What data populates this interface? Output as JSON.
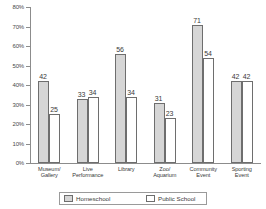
{
  "chart_data": {
    "type": "bar",
    "title": "",
    "subtitle": "",
    "xlabel": "",
    "ylabel": "",
    "ylim": [
      0,
      80
    ],
    "ytick_labels": [
      "80%",
      "70%",
      "60%",
      "50%",
      "40%",
      "30%",
      "20%",
      "10%",
      "0%"
    ],
    "ytick_values": [
      80,
      70,
      60,
      50,
      40,
      30,
      20,
      10,
      0
    ],
    "grid": false,
    "legend_position": "bottom",
    "value_suffix": "%",
    "categories": [
      "Museum/\nGallery",
      "Live\nPerformance",
      "Library",
      "Zoo/\nAquarium",
      "Community\nEvent",
      "Sporting\nEvent"
    ],
    "category_lines": [
      [
        "Museum/",
        "Gallery"
      ],
      [
        "Live",
        "Performance"
      ],
      [
        "Library",
        ""
      ],
      [
        "Zoo/",
        "Aquarium"
      ],
      [
        "Community",
        "Event"
      ],
      [
        "Sporting",
        "Event"
      ]
    ],
    "series": [
      {
        "name": "Homeschool",
        "values": [
          42,
          33,
          56,
          31,
          71,
          42
        ],
        "labels": [
          "42",
          "33",
          "56",
          "31",
          "71",
          "42"
        ],
        "color": "#d6d6d6",
        "pattern": "stipple"
      },
      {
        "name": "Public School",
        "values": [
          25,
          34,
          34,
          23,
          54,
          42
        ],
        "labels": [
          "25",
          "34",
          "34",
          "23",
          "54",
          "42"
        ],
        "color": "#ffffff",
        "pattern": "solid"
      }
    ]
  },
  "legend": {
    "items": [
      {
        "label": "Homeschool",
        "swatch": "homeschool-swatch"
      },
      {
        "label": "Public School",
        "swatch": "public-school-swatch"
      }
    ]
  }
}
